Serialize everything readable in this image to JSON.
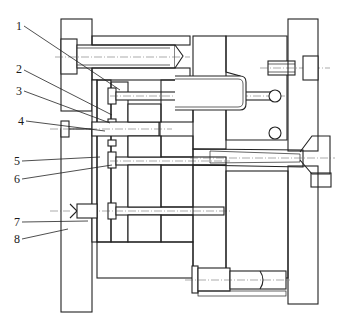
{
  "figure": {
    "type": "injection mold cross-section (engineering drawing)",
    "callouts": [
      {
        "id": "callout-1",
        "label": "1"
      },
      {
        "id": "callout-2",
        "label": "2"
      },
      {
        "id": "callout-3",
        "label": "3"
      },
      {
        "id": "callout-4",
        "label": "4"
      },
      {
        "id": "callout-5",
        "label": "5"
      },
      {
        "id": "callout-6",
        "label": "6"
      },
      {
        "id": "callout-7",
        "label": "7"
      },
      {
        "id": "callout-8",
        "label": "8"
      }
    ],
    "colors": {
      "line": "#222222",
      "background": "#ffffff",
      "hatch": "#333333"
    }
  }
}
